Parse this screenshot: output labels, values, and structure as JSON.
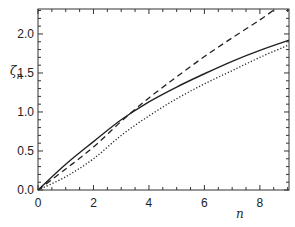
{
  "chart_data": {
    "type": "line",
    "title": "",
    "xlabel": "n",
    "ylabel": "ζn",
    "xlim": [
      0,
      9.05
    ],
    "ylim": [
      0,
      2.32
    ],
    "grid": false,
    "legend": null,
    "x_ticks": [
      0,
      2,
      4,
      6,
      8
    ],
    "x_tick_labels": [
      "0",
      "2",
      "4",
      "6",
      "8"
    ],
    "y_ticks": [
      0.0,
      0.5,
      1.0,
      1.5,
      2.0
    ],
    "y_tick_labels": [
      "0.0",
      "0.5",
      "1.0",
      "1.5",
      "2.0"
    ],
    "series": [
      {
        "name": "solid",
        "style": "solid",
        "color": "#222222",
        "x": [
          0,
          1,
          2,
          3,
          4,
          5,
          6,
          7,
          8,
          9.05
        ],
        "values": [
          0,
          0.33,
          0.62,
          0.9,
          1.13,
          1.32,
          1.49,
          1.65,
          1.79,
          1.92
        ]
      },
      {
        "name": "dashed",
        "style": "dashed",
        "color": "#222222",
        "x": [
          0,
          1,
          2,
          3,
          4,
          5,
          6,
          7,
          8,
          8.55
        ],
        "values": [
          0,
          0.27,
          0.55,
          0.88,
          1.18,
          1.45,
          1.71,
          1.95,
          2.18,
          2.32
        ]
      },
      {
        "name": "dotted",
        "style": "dotted",
        "color": "#222222",
        "x": [
          0,
          1,
          2,
          3,
          4,
          5,
          6,
          7,
          8,
          9.05
        ],
        "values": [
          0,
          0.17,
          0.4,
          0.7,
          0.95,
          1.17,
          1.36,
          1.53,
          1.7,
          1.86
        ]
      }
    ]
  },
  "labels": {
    "xlabel": "n",
    "ylabel_main": "ζ",
    "ylabel_sub": "n"
  }
}
